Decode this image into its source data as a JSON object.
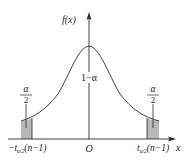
{
  "diagram": {
    "type": "probability-density",
    "y_axis_label": "f(x)",
    "x_axis_label": "x",
    "origin_label": "O",
    "center_area_label": "1−α",
    "left_tail": {
      "area_numerator": "α",
      "area_denominator": "2",
      "tick_label_prefix": "−t",
      "tick_label_sub": "α/2",
      "tick_label_suffix": "(n−1)"
    },
    "right_tail": {
      "area_numerator": "α",
      "area_denominator": "2",
      "tick_label_prefix": "t",
      "tick_label_sub": "α/2",
      "tick_label_suffix": "(n−1)"
    },
    "colors": {
      "line": "#2a2a2a",
      "shade": "#b8b8b8",
      "background": "#ffffff"
    }
  }
}
